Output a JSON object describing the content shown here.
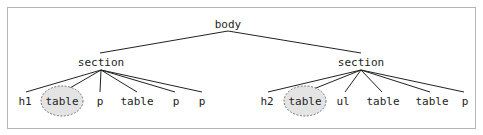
{
  "diagram": {
    "type": "dom-tree",
    "frame": {
      "x": 7,
      "y": 7,
      "width": 468,
      "height": 121,
      "stroke": "#b5b5b5"
    },
    "colors": {
      "line": "#222222",
      "highlight_fill": "#e4e4e4",
      "highlight_stroke": "#555555"
    },
    "root": {
      "id": "body",
      "label": "body",
      "x": 228,
      "y": 28
    },
    "sections": [
      {
        "id": "section-left",
        "label": "section",
        "x": 101,
        "y": 66
      },
      {
        "id": "section-right",
        "label": "section",
        "x": 361,
        "y": 66
      }
    ],
    "leaves": [
      {
        "id": "left-h1",
        "parent": "section-left",
        "label": "h1",
        "x": 25,
        "y": 105,
        "highlighted": false
      },
      {
        "id": "left-table-1",
        "parent": "section-left",
        "label": "table",
        "x": 62,
        "y": 105,
        "highlighted": true
      },
      {
        "id": "left-p-1",
        "parent": "section-left",
        "label": "p",
        "x": 100,
        "y": 105,
        "highlighted": false
      },
      {
        "id": "left-table-2",
        "parent": "section-left",
        "label": "table",
        "x": 137,
        "y": 105,
        "highlighted": false
      },
      {
        "id": "left-p-2",
        "parent": "section-left",
        "label": "p",
        "x": 176,
        "y": 105,
        "highlighted": false
      },
      {
        "id": "left-p-3",
        "parent": "section-left",
        "label": "p",
        "x": 202,
        "y": 105,
        "highlighted": false
      },
      {
        "id": "right-h2",
        "parent": "section-right",
        "label": "h2",
        "x": 267,
        "y": 105,
        "highlighted": false
      },
      {
        "id": "right-table-1",
        "parent": "section-right",
        "label": "table",
        "x": 305,
        "y": 105,
        "highlighted": true
      },
      {
        "id": "right-ul",
        "parent": "section-right",
        "label": "ul",
        "x": 343,
        "y": 105,
        "highlighted": false
      },
      {
        "id": "right-table-2",
        "parent": "section-right",
        "label": "table",
        "x": 383,
        "y": 105,
        "highlighted": false
      },
      {
        "id": "right-table-3",
        "parent": "section-right",
        "label": "table",
        "x": 432,
        "y": 105,
        "highlighted": false
      },
      {
        "id": "right-p",
        "parent": "section-right",
        "label": "p",
        "x": 465,
        "y": 105,
        "highlighted": false
      }
    ],
    "edges": [
      {
        "from": [
          228,
          31
        ],
        "to": [
          100,
          53
        ]
      },
      {
        "from": [
          228,
          31
        ],
        "to": [
          361,
          53
        ]
      },
      {
        "from": [
          101,
          70
        ],
        "to": [
          26,
          92
        ]
      },
      {
        "from": [
          101,
          70
        ],
        "to": [
          63,
          92
        ]
      },
      {
        "from": [
          101,
          70
        ],
        "to": [
          100,
          92
        ]
      },
      {
        "from": [
          101,
          70
        ],
        "to": [
          137,
          92
        ]
      },
      {
        "from": [
          101,
          70
        ],
        "to": [
          175,
          92
        ]
      },
      {
        "from": [
          101,
          70
        ],
        "to": [
          202,
          92
        ]
      },
      {
        "from": [
          361,
          70
        ],
        "to": [
          268,
          92
        ]
      },
      {
        "from": [
          361,
          70
        ],
        "to": [
          306,
          92
        ]
      },
      {
        "from": [
          361,
          70
        ],
        "to": [
          345,
          92
        ]
      },
      {
        "from": [
          361,
          70
        ],
        "to": [
          382,
          92
        ]
      },
      {
        "from": [
          361,
          70
        ],
        "to": [
          430,
          92
        ]
      },
      {
        "from": [
          361,
          70
        ],
        "to": [
          464,
          92
        ]
      }
    ]
  }
}
